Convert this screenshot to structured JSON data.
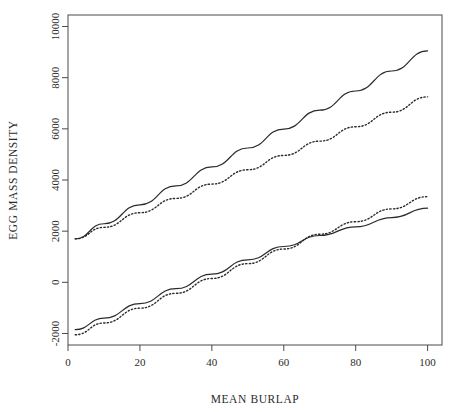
{
  "chart_data": {
    "type": "line",
    "title": "",
    "xlabel": "MEAN BURLAP",
    "ylabel": "EGG MASS DENSITY",
    "xlim": [
      0,
      104
    ],
    "ylim": [
      -2450,
      10450
    ],
    "xticks": [
      0,
      20,
      40,
      60,
      80,
      100
    ],
    "xtick_labels": [
      "0",
      "20",
      "40",
      "60",
      "80",
      "100"
    ],
    "yticks": [
      -2000,
      0,
      2000,
      4000,
      6000,
      8000,
      10000
    ],
    "ytick_labels": [
      "-2000",
      "0",
      "2000",
      "4000",
      "6000",
      "8000",
      "10000"
    ],
    "grid": false,
    "legend": "none",
    "box": true,
    "series": [
      {
        "name": "upper-solid",
        "style": "solid",
        "color": "#2b2b2b",
        "x": [
          2,
          10,
          20,
          30,
          40,
          50,
          60,
          70,
          80,
          90,
          100
        ],
        "y": [
          1700,
          2290,
          3030,
          3770,
          4510,
          5250,
          5990,
          6730,
          7480,
          8260,
          9050
        ]
      },
      {
        "name": "upper-dotted",
        "style": "dotted",
        "color": "#2b2b2b",
        "x": [
          2,
          10,
          20,
          30,
          40,
          50,
          60,
          70,
          80,
          90,
          100
        ],
        "y": [
          1700,
          2150,
          2720,
          3280,
          3840,
          4400,
          4960,
          5520,
          6080,
          6650,
          7250
        ]
      },
      {
        "name": "lower-solid",
        "style": "solid",
        "color": "#2b2b2b",
        "x": [
          2,
          10,
          20,
          30,
          40,
          50,
          60,
          70,
          80,
          90,
          100
        ],
        "y": [
          -1850,
          -1400,
          -830,
          -250,
          320,
          880,
          1400,
          1830,
          2170,
          2530,
          2900
        ]
      },
      {
        "name": "lower-dotted",
        "style": "dotted",
        "color": "#2b2b2b",
        "x": [
          2,
          10,
          20,
          30,
          40,
          50,
          60,
          70,
          80,
          90,
          100
        ],
        "y": [
          -2050,
          -1590,
          -1010,
          -430,
          150,
          730,
          1300,
          1880,
          2370,
          2870,
          3350
        ]
      }
    ]
  }
}
